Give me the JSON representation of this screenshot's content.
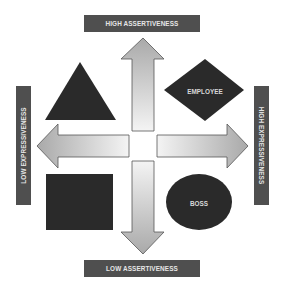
{
  "diagram": {
    "axes": {
      "top": {
        "label": "HIGH ASSERTIVENESS"
      },
      "bottom": {
        "label": "LOW ASSERTIVENESS"
      },
      "left": {
        "label": "LOW EXPRESSIVENESS"
      },
      "right": {
        "label": "HIGH EXPRESSIVENESS"
      }
    },
    "quadrants": [
      {
        "position": "top-left",
        "shape": "triangle",
        "label": ""
      },
      {
        "position": "top-right",
        "shape": "diamond",
        "label": "EMPLOYEE"
      },
      {
        "position": "bottom-left",
        "shape": "square",
        "label": ""
      },
      {
        "position": "bottom-right",
        "shape": "ellipse",
        "label": "BOSS"
      }
    ],
    "arrows": [
      {
        "direction": "up"
      },
      {
        "direction": "down"
      },
      {
        "direction": "left"
      },
      {
        "direction": "right"
      }
    ],
    "colors": {
      "label_bar": "#4f4f4f",
      "label_text": "#e6e6e6",
      "shape_fill": "#2a2a2a",
      "arrow_dark": "#a9a9a9",
      "arrow_light": "#f2f2f2",
      "arrow_stroke": "#555555"
    }
  }
}
